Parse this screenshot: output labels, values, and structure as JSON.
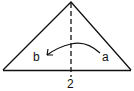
{
  "diagram": {
    "labels": {
      "start_point": "a",
      "end_point": "b",
      "step_number": "2"
    },
    "colors": {
      "stroke": "#111111",
      "background": "#ffffff"
    },
    "elements": {
      "shape": "triangle",
      "center_line": "dashed fold line",
      "arrow": "curved fold arrow from a to b"
    }
  }
}
